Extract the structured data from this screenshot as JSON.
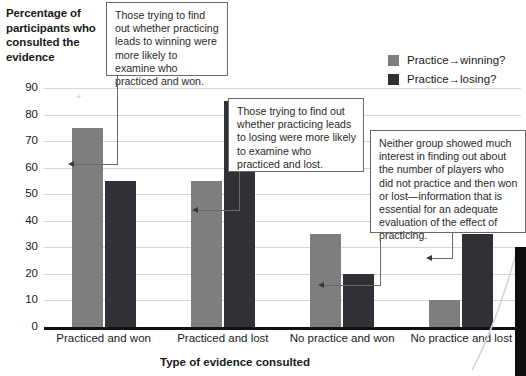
{
  "chart_data": {
    "type": "bar",
    "title": "",
    "xlabel": "Type of evidence consulted",
    "ylabel": "Percentage of participants who consulted the evidence",
    "categories": [
      "Practiced and won",
      "Practiced and lost",
      "No practice and won",
      "No practice and lost"
    ],
    "series": [
      {
        "name": "Practice→winning?",
        "color": "#7e7e7e",
        "values": [
          75,
          55,
          35,
          10
        ]
      },
      {
        "name": "Practice→losing?",
        "color": "#2f3136",
        "values": [
          55,
          85,
          20,
          35
        ]
      }
    ],
    "ylim": [
      0,
      90
    ],
    "ytick_labels": [
      "90",
      "80",
      "70",
      "60",
      "50",
      "40",
      "30",
      "20",
      "10",
      "0"
    ],
    "ytick_values": [
      90,
      80,
      70,
      60,
      50,
      40,
      30,
      20,
      10,
      0
    ],
    "grid": true,
    "legend_position": "top-right"
  },
  "axes": {
    "y_title": "Percentage of participants who consulted the evidence",
    "x_title": "Type of evidence consulted"
  },
  "legend": {
    "items": [
      {
        "label": "Practice→winning?",
        "color": "#7e7e7e"
      },
      {
        "label": "Practice→losing?",
        "color": "#2f3136"
      }
    ]
  },
  "annotations": [
    {
      "id": "callout-1",
      "text": "Those trying to find out whether practicing leads to winning were more likely to examine who practiced and won.",
      "points_to": "Practiced and won / Practice→winning?"
    },
    {
      "id": "callout-2",
      "text": "Those trying to find out whether practicing leads to losing were more likely to examine who practiced and lost.",
      "points_to": "Practiced and lost / Practice→losing?"
    },
    {
      "id": "callout-3",
      "text": "Neither group showed much interest in finding out about the number of players who did not practice and then won or lost—information that is essential for an adequate evaluation of the effect of practicing.",
      "points_to": "No practice and won / No practice and lost"
    }
  ]
}
